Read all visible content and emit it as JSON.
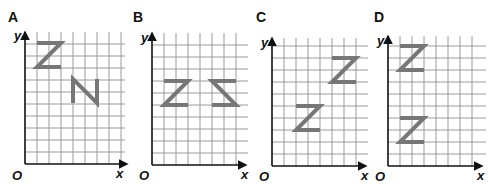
{
  "figure": {
    "colors": {
      "grid": "#9a9a9a",
      "axis": "#111111",
      "shape": "#777777"
    },
    "grid_cell_px": 12,
    "panels": [
      {
        "label": "A",
        "axis_x_label": "x",
        "axis_y_label": "y",
        "origin_label": "O",
        "shapes": [
          {
            "glyph": "Z",
            "orientation": "upright",
            "col": 1,
            "row_from_top": 1,
            "width_cells": 2,
            "height_cells": 2
          },
          {
            "glyph": "N",
            "orientation": "rotated-90 (N)",
            "col": 4,
            "row_from_top": 4,
            "width_cells": 2,
            "height_cells": 2
          }
        ]
      },
      {
        "label": "B",
        "axis_x_label": "x",
        "axis_y_label": "y",
        "origin_label": "O",
        "shapes": [
          {
            "glyph": "Z",
            "orientation": "upright",
            "col": 1,
            "row_from_top": 4,
            "width_cells": 2,
            "height_cells": 2
          },
          {
            "glyph": "Z",
            "orientation": "reflected horizontally",
            "col": 5,
            "row_from_top": 4,
            "width_cells": 2,
            "height_cells": 2
          }
        ]
      },
      {
        "label": "C",
        "axis_x_label": "x",
        "axis_y_label": "y",
        "origin_label": "O",
        "shapes": [
          {
            "glyph": "Z",
            "orientation": "upright",
            "col": 2,
            "row_from_top": 6,
            "width_cells": 2,
            "height_cells": 2
          },
          {
            "glyph": "Z",
            "orientation": "upright (translated)",
            "col": 5,
            "row_from_top": 2,
            "width_cells": 2,
            "height_cells": 2
          }
        ]
      },
      {
        "label": "D",
        "axis_x_label": "x",
        "axis_y_label": "y",
        "origin_label": "O",
        "shapes": [
          {
            "glyph": "Z",
            "orientation": "upright",
            "col": 1,
            "row_from_top": 1,
            "width_cells": 2,
            "height_cells": 2
          },
          {
            "glyph": "Z",
            "orientation": "reflected vertically",
            "col": 1,
            "row_from_top": 7,
            "width_cells": 2,
            "height_cells": 2
          }
        ]
      }
    ]
  }
}
